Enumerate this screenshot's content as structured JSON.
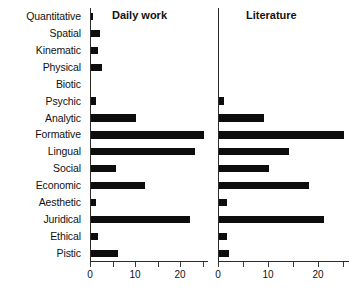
{
  "chart_data": {
    "type": "bar",
    "orientation": "horizontal",
    "title": "",
    "xlabel": "",
    "ylabel": "",
    "xlim": [
      0,
      26
    ],
    "grid": false,
    "legend": "none",
    "categories": [
      "Quantitative",
      "Spatial",
      "Kinematic",
      "Physical",
      "Biotic",
      "Psychic",
      "Analytic",
      "Formative",
      "Lingual",
      "Social",
      "Economic",
      "Aesthetic",
      "Juridical",
      "Ethical",
      "Pistic"
    ],
    "panels": [
      {
        "title": "Daily work",
        "xticks": [
          0,
          5,
          10,
          15,
          20,
          25
        ],
        "xticklabels": [
          "0",
          "",
          "10",
          "",
          "20",
          ""
        ],
        "values": [
          0.5,
          2,
          1.5,
          2.5,
          0,
          1,
          10,
          25,
          23,
          5.5,
          12,
          1,
          22,
          1.5,
          6
        ]
      },
      {
        "title": "Literature",
        "xticks": [
          0,
          5,
          10,
          15,
          20,
          25
        ],
        "xticklabels": [
          "0",
          "",
          "10",
          "",
          "20",
          ""
        ],
        "values": [
          0,
          0,
          0,
          0,
          0,
          1,
          9,
          25,
          14,
          10,
          18,
          1.5,
          21,
          1.5,
          2
        ]
      }
    ]
  }
}
